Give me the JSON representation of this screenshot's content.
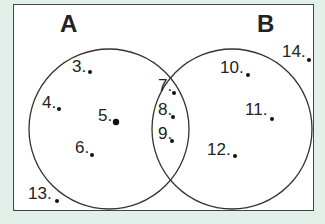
{
  "sets": [
    {
      "name": "A",
      "label_pos": [
        60,
        10
      ]
    },
    {
      "name": "B",
      "label_pos": [
        257,
        10
      ]
    }
  ],
  "circles": [
    {
      "set": "A",
      "cx": 109,
      "cy": 129,
      "r": 80
    },
    {
      "set": "B",
      "cx": 232,
      "cy": 129,
      "r": 80
    }
  ],
  "points": [
    {
      "label": "3",
      "x": 72,
      "y": 57,
      "dx": 90,
      "dy": 72,
      "region": "A only"
    },
    {
      "label": "4",
      "x": 42,
      "y": 93,
      "dx": 59,
      "dy": 109,
      "region": "A only"
    },
    {
      "label": "5",
      "x": 98,
      "y": 106,
      "dx": 116,
      "dy": 122,
      "region": "A only"
    },
    {
      "label": "6",
      "x": 75,
      "y": 138,
      "dx": 92,
      "dy": 155,
      "region": "A only"
    },
    {
      "label": "7",
      "x": 158,
      "y": 76,
      "dx": 174,
      "dy": 93,
      "region": "A and B"
    },
    {
      "label": "8",
      "x": 158,
      "y": 100,
      "dx": 173,
      "dy": 117,
      "region": "A and B"
    },
    {
      "label": "9",
      "x": 158,
      "y": 124,
      "dx": 172,
      "dy": 141,
      "region": "A and B"
    },
    {
      "label": "10",
      "x": 220,
      "y": 58,
      "dx": 248,
      "dy": 75,
      "region": "B only"
    },
    {
      "label": "11",
      "x": 245,
      "y": 100,
      "dx": 272,
      "dy": 119,
      "region": "B only"
    },
    {
      "label": "12",
      "x": 207,
      "y": 140,
      "dx": 235,
      "dy": 156,
      "region": "B only"
    },
    {
      "label": "13",
      "x": 28,
      "y": 184,
      "dx": 57,
      "dy": 201,
      "region": "outside"
    },
    {
      "label": "14",
      "x": 282,
      "y": 42,
      "dx": 309,
      "dy": 60,
      "region": "outside"
    }
  ]
}
